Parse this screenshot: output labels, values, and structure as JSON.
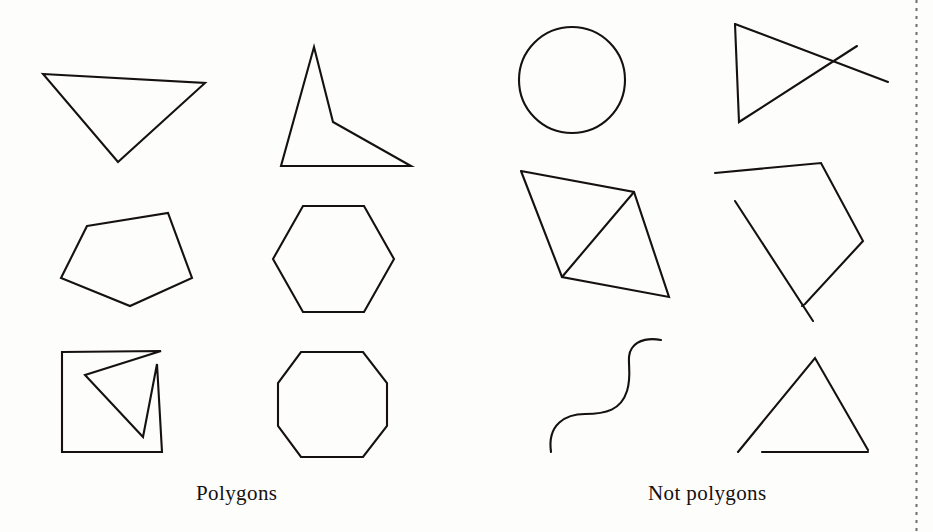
{
  "page": {
    "background_color": "#fdfdfc",
    "stroke_color": "#15110f",
    "width": 933,
    "height": 532
  },
  "captions": {
    "left": "Polygons",
    "right": "Not polygons"
  },
  "columns": [
    {
      "name": "polygons",
      "caption": "Polygons",
      "shapes": [
        {
          "name": "scalene-triangle",
          "label": "triangle",
          "closed": true,
          "points": [
            [
              43,
              74
            ],
            [
              205,
              83
            ],
            [
              118,
              162
            ]
          ]
        },
        {
          "name": "concave-quadrilateral",
          "label": "concave quadrilateral",
          "closed": true,
          "points": [
            [
              314,
              47
            ],
            [
              333,
              122
            ],
            [
              411,
              166
            ],
            [
              281,
              166
            ]
          ]
        },
        {
          "name": "irregular-pentagon",
          "label": "pentagon",
          "closed": true,
          "points": [
            [
              87,
              226
            ],
            [
              168,
              213
            ],
            [
              192,
              278
            ],
            [
              130,
              306
            ],
            [
              61,
              278
            ]
          ]
        },
        {
          "name": "regular-hexagon",
          "label": "hexagon",
          "closed": true,
          "points": [
            [
              303,
              206
            ],
            [
              364,
              206
            ],
            [
              394,
              259
            ],
            [
              364,
              312
            ],
            [
              303,
              312
            ],
            [
              273,
              259
            ]
          ]
        },
        {
          "name": "self-intersecting-square",
          "label": "self-intersecting square polygon",
          "closed": true,
          "points": [
            [
              62,
              352
            ],
            [
              161,
              351
            ],
            [
              85,
              375
            ],
            [
              143,
              437
            ],
            [
              157,
              364
            ],
            [
              162,
              452
            ],
            [
              62,
              452
            ]
          ]
        },
        {
          "name": "regular-octagon",
          "label": "octagon",
          "closed": true,
          "points": [
            [
              301,
              352
            ],
            [
              363,
              352
            ],
            [
              387,
              383
            ],
            [
              387,
              426
            ],
            [
              363,
              457
            ],
            [
              301,
              457
            ],
            [
              278,
              426
            ],
            [
              278,
              383
            ]
          ]
        }
      ]
    },
    {
      "name": "not-polygons",
      "caption": "Not polygons",
      "shapes": [
        {
          "name": "circle",
          "label": "circle",
          "type": "circle",
          "center": [
            572,
            80
          ],
          "radius": 53
        },
        {
          "name": "crossed-open-figure",
          "label": "open crossed figure",
          "type": "polyline-group",
          "paths": [
            [
              [
                735,
                24
              ],
              [
                739,
                122
              ],
              [
                857,
                46
              ]
            ],
            [
              [
                735,
                24
              ],
              [
                888,
                82
              ]
            ]
          ]
        },
        {
          "name": "quadrilateral-with-diagonal",
          "label": "quadrilateral with interior diagonal",
          "type": "polyline-group",
          "paths": [
            [
              [
                521,
                171
              ],
              [
                634,
                192
              ],
              [
                669,
                297
              ],
              [
                562,
                277
              ],
              [
                521,
                171
              ]
            ],
            [
              [
                634,
                192
              ],
              [
                562,
                277
              ]
            ]
          ]
        },
        {
          "name": "open-square-with-overshoot",
          "label": "open square with overshooting side",
          "type": "polyline-group",
          "paths": [
            [
              [
                715,
                173
              ],
              [
                821,
                163
              ],
              [
                863,
                241
              ],
              [
                805,
                304
              ],
              [
                802,
                306
              ]
            ],
            [
              [
                735,
                201
              ],
              [
                813,
                321
              ]
            ]
          ]
        },
        {
          "name": "wavy-curve",
          "label": "wavy curve",
          "type": "path",
          "d": "M 551 452 C 547 424 566 414 585 414 C 606 414 621 410 627 391 C 633 372 625 358 632 348 C 638 339 651 338 661 340"
        },
        {
          "name": "open-triangle",
          "label": "open triangle",
          "type": "polyline-group",
          "paths": [
            [
              [
                738,
                452
              ],
              [
                815,
                358
              ],
              [
                868,
                450
              ]
            ],
            [
              [
                762,
                452
              ],
              [
                868,
                452
              ]
            ]
          ]
        }
      ]
    }
  ],
  "page_edge": {
    "name": "dotted-page-edge",
    "dot_color": "#6e6e6e"
  }
}
